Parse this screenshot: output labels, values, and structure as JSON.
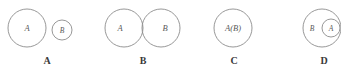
{
  "figure": {
    "background_color": "#ffffff",
    "stroke_color": "#8c8c8c",
    "label_color": "#5a5a5a",
    "option_label_color": "#3a3a3a",
    "width": 341,
    "height": 77
  },
  "options": [
    {
      "key": "A",
      "option_label": "A",
      "relation": "disjoint",
      "description": "large circle A and separate small circle B, no overlap",
      "shapes": [
        {
          "name": "circle-a",
          "label": "A",
          "cx": 27,
          "cy": 28,
          "r": 19
        },
        {
          "name": "circle-b",
          "label": "B",
          "cx": 62,
          "cy": 30,
          "r": 10
        }
      ],
      "label_x": 47,
      "label_y": 62
    },
    {
      "key": "B",
      "option_label": "B",
      "relation": "overlapping",
      "description": "two equal circles A and B partially overlapping",
      "shapes": [
        {
          "name": "circle-a",
          "label": "A",
          "cx": 124,
          "cy": 28,
          "r": 19
        },
        {
          "name": "circle-b",
          "label": "B",
          "cx": 161,
          "cy": 28,
          "r": 19
        }
      ],
      "label_x": 143,
      "label_y": 62
    },
    {
      "key": "C",
      "option_label": "C",
      "relation": "coincident",
      "description": "single circle labeled A(B), sets are identical",
      "shapes": [
        {
          "name": "circle-ab",
          "label": "A(B)",
          "cx": 233,
          "cy": 28,
          "r": 19
        }
      ],
      "label_x": 234,
      "label_y": 62
    },
    {
      "key": "D",
      "option_label": "D",
      "relation": "subset",
      "description": "small circle A fully inside larger circle B, clipped at right edge",
      "shapes": [
        {
          "name": "circle-b",
          "label": "B",
          "cx": 322,
          "cy": 28,
          "r": 19
        },
        {
          "name": "circle-a",
          "label": "A",
          "cx": 331,
          "cy": 28,
          "r": 9
        }
      ],
      "label_x": 324,
      "label_y": 62
    }
  ],
  "set_labels": {
    "a": "A",
    "b": "B",
    "ab": "A(B)"
  }
}
